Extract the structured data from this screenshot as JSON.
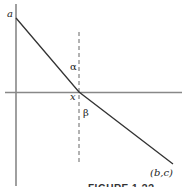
{
  "figure": {
    "caption": "FIGURE 1.??",
    "labels": {
      "y_intercept": "a",
      "x_intercept": "x",
      "endpoint": "(b,c)",
      "angle_above": "α",
      "angle_below": "β"
    },
    "colors": {
      "axis": "#888888",
      "curve": "#333333",
      "dashed": "#666666",
      "text": "#222222"
    }
  }
}
